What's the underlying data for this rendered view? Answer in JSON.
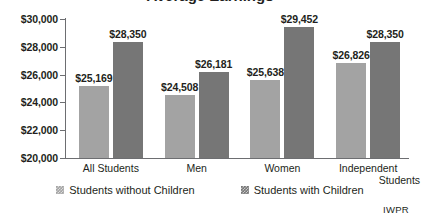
{
  "chart_data": {
    "type": "bar",
    "title": "Average Earnings",
    "title_visibility": "cropped-at-top-edge",
    "categories": [
      "All Students",
      "Men",
      "Women",
      "Independent Students"
    ],
    "series": [
      {
        "name": "Students without Children",
        "color": "#a3a3a3",
        "values": [
          25169,
          24508,
          25638,
          26826
        ],
        "labels": [
          "$25,169",
          "$24,508",
          "$25,638",
          "$26,826"
        ]
      },
      {
        "name": "Students with Children",
        "color": "#767676",
        "values": [
          28350,
          26181,
          29452,
          28350
        ],
        "labels": [
          "$28,350",
          "$26,181",
          "$29,452",
          "$28,350"
        ]
      }
    ],
    "xlabel": "",
    "ylabel": "",
    "ylim": [
      20000,
      30000
    ],
    "ytick_step": 2000,
    "yticks": [
      20000,
      22000,
      24000,
      26000,
      28000,
      30000
    ],
    "ytick_labels": [
      "$20,000",
      "$22,000",
      "$24,000",
      "$26,000",
      "$28,000",
      "$30,000"
    ],
    "grid": false,
    "legend_position": "bottom-center"
  },
  "category_lines": [
    {
      "line1": "All Students",
      "line2": ""
    },
    {
      "line1": "Men",
      "line2": ""
    },
    {
      "line1": "Women",
      "line2": ""
    },
    {
      "line1": "Independent",
      "line2": "Students"
    }
  ],
  "legend": {
    "items": [
      {
        "label": "Students without Children",
        "color": "#a3a3a3"
      },
      {
        "label": "Students with Children",
        "color": "#767676"
      }
    ]
  },
  "attribution": {
    "text": "IWPR"
  },
  "colors": {
    "series_without_children": "#a3a3a3",
    "series_with_children": "#767676",
    "axis": "#6d6e71",
    "text": "#231f20",
    "background": "#ffffff"
  }
}
